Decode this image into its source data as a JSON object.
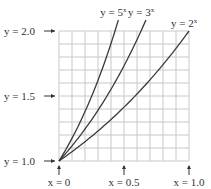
{
  "chart_data": {
    "type": "line",
    "title": "",
    "xlabel": "",
    "ylabel": "",
    "xlim": [
      0,
      1.0
    ],
    "ylim": [
      1.0,
      2.0
    ],
    "grid": true,
    "x_ticks": [
      {
        "value": 0,
        "label": "x = 0"
      },
      {
        "value": 0.5,
        "label": "x = 0.5"
      },
      {
        "value": 1.0,
        "label": "x = 1.0"
      }
    ],
    "y_ticks": [
      {
        "value": 1.0,
        "label": "y = 1.0"
      },
      {
        "value": 1.5,
        "label": "y = 1.5"
      },
      {
        "value": 2.0,
        "label": "y = 2.0"
      }
    ],
    "series": [
      {
        "name": "y = 5^x",
        "label_base": "y = 5",
        "label_exp": "x",
        "base": 5,
        "x": [
          0,
          0.1,
          0.2,
          0.3,
          0.4,
          0.43
        ],
        "values": [
          1.0,
          1.175,
          1.38,
          1.621,
          1.904,
          2.0
        ]
      },
      {
        "name": "y = 3^x",
        "label_base": "y = 3",
        "label_exp": "x",
        "base": 3,
        "x": [
          0,
          0.1,
          0.2,
          0.3,
          0.4,
          0.5,
          0.6,
          0.63
        ],
        "values": [
          1.0,
          1.116,
          1.246,
          1.39,
          1.552,
          1.732,
          1.933,
          2.0
        ]
      },
      {
        "name": "y = 2^x",
        "label_base": "y = 2",
        "label_exp": "x",
        "base": 2,
        "x": [
          0,
          0.2,
          0.4,
          0.6,
          0.8,
          1.0
        ],
        "values": [
          1.0,
          1.149,
          1.32,
          1.516,
          1.741,
          2.0
        ]
      }
    ]
  },
  "colors": {
    "grid": "#c8c8c8",
    "curve": "#3a3a3a",
    "text": "#333333"
  }
}
